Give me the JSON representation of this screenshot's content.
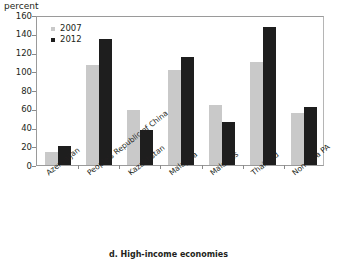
{
  "caption": "d. High-income economies",
  "chart_data": {
    "type": "bar",
    "title": "",
    "subtitle": "",
    "unit_label": "percent",
    "xlabel": "",
    "ylabel": "",
    "ylim": [
      0,
      160
    ],
    "ytick_step": 20,
    "yticks": [
      0,
      20,
      40,
      60,
      80,
      100,
      120,
      140,
      160
    ],
    "ytick_labels": [
      "0",
      "20",
      "40",
      "60",
      "80",
      "100",
      "120",
      "140",
      "160"
    ],
    "grid": false,
    "legend_position": "top-left",
    "categories": [
      "Azerbaijan",
      "People's Republic of China",
      "Kazakhstan",
      "Malaysia",
      "Maldives",
      "Thailand",
      "Non-Asia PA"
    ],
    "series": [
      {
        "name": "2007",
        "color": "#c9c9c9",
        "values": [
          14,
          107,
          59,
          101,
          64,
          110,
          55
        ]
      },
      {
        "name": "2012",
        "color": "#1e1e1e",
        "values": [
          20,
          134,
          37,
          115,
          46,
          147,
          62
        ]
      }
    ]
  }
}
